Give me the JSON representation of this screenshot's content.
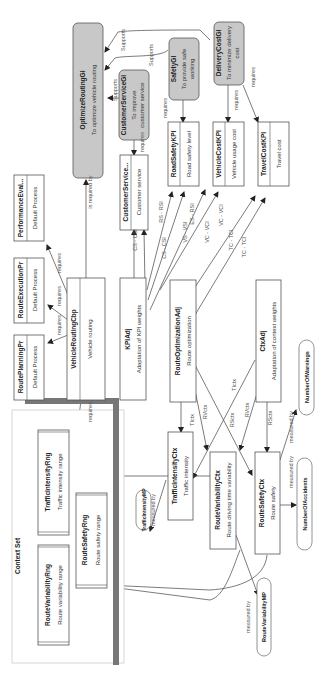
{
  "diagram": {
    "orientation": "rotated-90-ccw",
    "context_set": {
      "title": "Context Set",
      "ranges": [
        {
          "name": "RouteVariabilityRng",
          "desc": "Route variability range"
        },
        {
          "name": "RouteSafetyRng",
          "desc": "Route safety range"
        },
        {
          "name": "TrafficIntensityRng",
          "desc": "Traffic intensity range"
        }
      ]
    },
    "goals": [
      {
        "name": "OptimizeRoutingGl",
        "desc": "To optimize vehicle routing"
      },
      {
        "name": "CustomerServiceGl",
        "desc": "To improve customer service"
      },
      {
        "name": "SafetyGl",
        "desc": "To provide safe working"
      },
      {
        "name": "DeliveryCostGl",
        "desc": "To minimize delivery cost"
      }
    ],
    "processes": [
      {
        "name": "RoutePlanningPr",
        "desc": "Default Process"
      },
      {
        "name": "RouteExecutionPr",
        "desc": "Default Process"
      },
      {
        "name": "PerformanceEval...",
        "desc": "Default Process"
      }
    ],
    "capability": {
      "name": "VehicleRoutingCbp",
      "desc": "Vehicle routing"
    },
    "kpis": [
      {
        "name": "CustomerService...",
        "desc": "Customer service"
      },
      {
        "name": "RoadSafetyKPI",
        "desc": "Road safety level"
      },
      {
        "name": "VehicleCostKPI",
        "desc": "Vehicle usage cost"
      },
      {
        "name": "TravelCostKPI",
        "desc": "Travel cost"
      }
    ],
    "adjustments": [
      {
        "name": "KPIAdj",
        "desc": "Adaptation of KPI weights"
      },
      {
        "name": "RouteOptimizationAdj",
        "desc": "Route optimization"
      },
      {
        "name": "CtxAdj",
        "desc": "Adaptation of context weights"
      }
    ],
    "contexts": [
      {
        "name": "TrafficIntensityCtx",
        "desc": "Traffic intensity"
      },
      {
        "name": "RouteVariabilityCtx",
        "desc": "Route driving time variability"
      },
      {
        "name": "RouteSafetyCtx",
        "desc": "Route safety"
      }
    ],
    "measures": [
      {
        "name": "TrafficIntensityMP"
      },
      {
        "name": "RouteVariabilityMP"
      },
      {
        "name": "NumberOfAccidents"
      },
      {
        "name": "NumberOfWarnings"
      }
    ],
    "edge_labels": {
      "supports": "Supports",
      "requires": "requires",
      "is_required_by": "is required by",
      "measured_by": "measured by",
      "cs_csi": "CS - CSI",
      "rs_rsi": "RS - RSI",
      "vc_vci": "VC - VCI",
      "tc_tci": "TC - TCI",
      "es_rsi": "ES - RSI",
      "vs_vsi": "VS - VSI",
      "ti_ctx": "TIctx",
      "rv_ctx": "RVctx",
      "rs_ctx": "RSctx"
    }
  }
}
